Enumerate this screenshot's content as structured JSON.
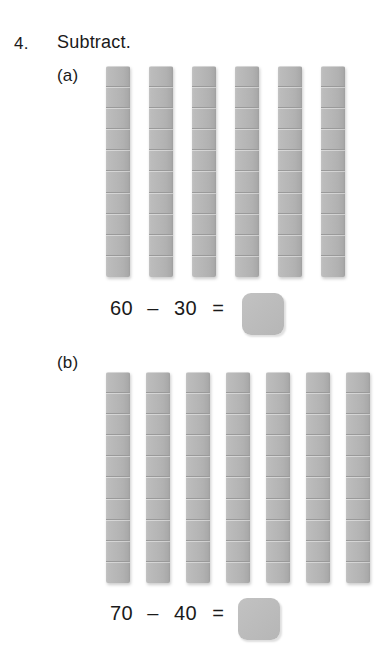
{
  "question": {
    "number": "4.",
    "title": "Subtract."
  },
  "parts": [
    {
      "label": "(a)",
      "rod_count": 6,
      "cells_per_rod": 10,
      "equation": {
        "minuend": "60",
        "operator": "–",
        "subtrahend": "30",
        "equals": "=",
        "answer": ""
      }
    },
    {
      "label": "(b)",
      "rod_count": 7,
      "cells_per_rod": 10,
      "equation": {
        "minuend": "70",
        "operator": "–",
        "subtrahend": "40",
        "equals": "=",
        "answer": ""
      }
    }
  ],
  "colors": {
    "rod_fill": "#b6b6b6",
    "rod_edge": "#9a9a9a",
    "answer_box_fill": "#bdbdbd",
    "text": "#1a1a1a",
    "page_background": "#ffffff"
  }
}
